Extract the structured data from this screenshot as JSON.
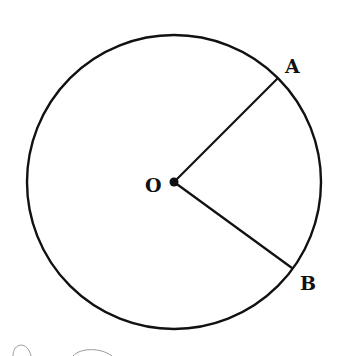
{
  "diagram": {
    "type": "circle-sector",
    "circle": {
      "cx": 174,
      "cy": 182,
      "r": 147,
      "stroke": "#111111",
      "stroke_width": 2.4
    },
    "center": {
      "label": "O",
      "x": 174,
      "y": 182,
      "dot_radius": 4.5
    },
    "points": [
      {
        "label": "A",
        "x": 278,
        "y": 78
      },
      {
        "label": "B",
        "x": 292,
        "y": 268
      }
    ],
    "radii": [
      {
        "from": "O",
        "to": "A"
      },
      {
        "from": "O",
        "to": "B"
      }
    ],
    "labels": {
      "O": {
        "text": "O",
        "x": 145,
        "y": 192
      },
      "A": {
        "text": "A",
        "x": 285,
        "y": 73
      },
      "B": {
        "text": "B",
        "x": 300,
        "y": 290
      }
    },
    "colors": {
      "ink": "#111111",
      "background": "#ffffff",
      "artifact": "#9a9a9a"
    }
  }
}
